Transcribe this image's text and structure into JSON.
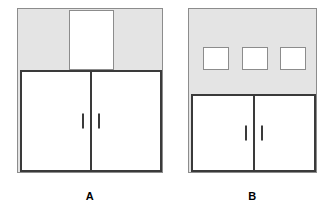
{
  "diagram": {
    "colors": {
      "panel_fill": "#e4e4e4",
      "panel_stroke": "#8c8c8c",
      "door_stroke": "#3a3a3a",
      "window_fill": "#ffffff",
      "background": "#ffffff",
      "label_color": "#000000"
    },
    "figures": [
      {
        "id": "a",
        "caption": "A",
        "upper_section": {
          "type": "single-tall-window",
          "window_count": 1,
          "windows": [
            {
              "name": "upper-window"
            }
          ]
        },
        "lower_section": {
          "type": "double-door",
          "door_count": 2,
          "doors": [
            {
              "side": "left",
              "handle": true
            },
            {
              "side": "right",
              "handle": true
            }
          ]
        }
      },
      {
        "id": "b",
        "caption": "B",
        "upper_section": {
          "type": "three-small-windows",
          "window_count": 3,
          "windows": [
            {
              "name": "upper-window-1"
            },
            {
              "name": "upper-window-2"
            },
            {
              "name": "upper-window-3"
            }
          ]
        },
        "lower_section": {
          "type": "double-door",
          "door_count": 2,
          "doors": [
            {
              "side": "left",
              "handle": true
            },
            {
              "side": "right",
              "handle": true
            }
          ]
        }
      }
    ]
  }
}
